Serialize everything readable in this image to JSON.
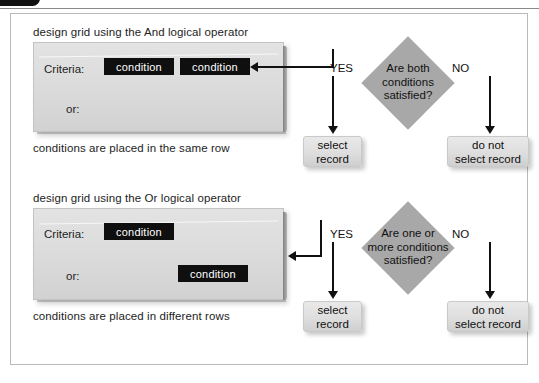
{
  "header": {
    "badge_label": "",
    "text": ""
  },
  "sections": [
    {
      "id": "and",
      "title": "design grid using the And logical operator",
      "footer": "conditions are placed in the same row",
      "grid": {
        "criteria_label": "Criteria:",
        "or_label": "or:",
        "criteria_conditions": [
          "condition",
          "condition"
        ],
        "or_conditions": []
      },
      "flow": {
        "decision": "Are both conditions satisfied?",
        "decision_lines": [
          "Are both",
          "conditions",
          "satisfied?"
        ],
        "yes_label": "YES",
        "no_label": "NO",
        "yes_outcome": "select record",
        "yes_outcome_lines": [
          "select",
          "record"
        ],
        "no_outcome": "do not select record",
        "no_outcome_lines": [
          "do not",
          "select record"
        ]
      }
    },
    {
      "id": "or",
      "title": "design grid using the Or logical operator",
      "footer": "conditions are placed in different rows",
      "grid": {
        "criteria_label": "Criteria:",
        "or_label": "or:",
        "criteria_conditions": [
          "condition"
        ],
        "or_conditions": [
          "condition"
        ]
      },
      "flow": {
        "decision": "Are one or more conditions satisfied?",
        "decision_lines": [
          "Are one or",
          "more conditions",
          "satisfied?"
        ],
        "yes_label": "YES",
        "no_label": "NO",
        "yes_outcome": "select record",
        "yes_outcome_lines": [
          "select",
          "record"
        ],
        "no_outcome": "do not select record",
        "no_outcome_lines": [
          "do not",
          "select record"
        ]
      }
    }
  ],
  "colors": {
    "condition_fill": "#0f0f0f",
    "condition_text": "#ffffff",
    "diamond_fill": "#a8a8a8",
    "panel_fill": "#dcdcdc",
    "terminal_fill": "#dedede",
    "line": "#111111",
    "frame_border": "#b9b9b9"
  }
}
